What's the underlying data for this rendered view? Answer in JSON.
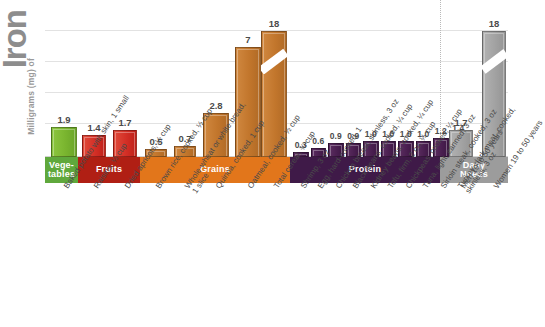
{
  "axis": {
    "title_main": "Iron",
    "title_units": "Milligrams (mg) of"
  },
  "bands": [
    {
      "key": "vegetables",
      "label": "Vege-\ntables",
      "color": "#5fa83c"
    },
    {
      "key": "fruits",
      "label": "Fruits",
      "color": "#b01f14"
    },
    {
      "key": "grains",
      "label": "Grains",
      "color": "#e2761b"
    },
    {
      "key": "protein",
      "label": "Protein",
      "color": "#3f1a48"
    },
    {
      "key": "daily_needs",
      "label": "Daily\nNeeds",
      "color": "#9c9c9c"
    }
  ],
  "chart_data": {
    "type": "bar",
    "title": "Iron",
    "ylabel": "Milligrams (mg) of Iron",
    "xlabel": "",
    "ylim": [
      0,
      8
    ],
    "grid": true,
    "legend": "none",
    "axis_break_note": "Bars for Total cereal (18 mg) and Women 19 to 50 years (18 mg) are drawn with a diagonal axis break.",
    "categories": [
      "Baked potato with skin, 1 small",
      "Raisins, ½ cup",
      "Dried apricots, ½ cup",
      "Brown rice, cooked, ½ cup",
      "Whole-wheat or white bread, 1 slice",
      "Quinoa, cooked, 1 cup",
      "Oatmeal, cooked, ½ cup",
      "Total cereal, ¾ cup",
      "Shrimp, 3 oz",
      "Egg, hard-cooked, 1",
      "Chicken breast, skinless, 3 oz",
      "Black beans, cooked, ¼ cup",
      "Kidney beans, cooked, ¼ cup",
      "Tofu, firm, 2 oz, ¼ cup",
      "Chickpeas, cooked, ¼ cup",
      "Tuna, light, canned, 3 oz",
      "Sirloin steak, cooked, 3 oz",
      "Turkey, dark meat, cooked, skinless, 3 oz",
      "Men 19 to 50 years",
      "Women 19 to 50 years"
    ],
    "values": [
      1.9,
      1.4,
      1.7,
      0.5,
      0.7,
      2.8,
      7,
      18,
      0.3,
      0.6,
      0.9,
      0.9,
      1.0,
      1.0,
      1.0,
      1.0,
      1.2,
      1.4,
      1.7,
      18
    ],
    "value_labels": [
      "1.9",
      "1.4",
      "1.7",
      "0.5",
      "0.7",
      "2.8",
      "7",
      "18",
      "0.3",
      "0.6",
      "0.9",
      "0.9",
      "1.0",
      "1.0",
      "1.0",
      "1.0",
      "1.2",
      "1.4",
      "1.7",
      "18"
    ],
    "groups": [
      "vegetables",
      "fruits",
      "fruits",
      "grains",
      "grains",
      "grains",
      "grains",
      "grains",
      "protein",
      "protein",
      "protein",
      "protein",
      "protein",
      "protein",
      "protein",
      "protein",
      "protein",
      "protein",
      "daily_needs",
      "daily_needs"
    ],
    "group_labels": {
      "vegetables": "Vege-tables",
      "fruits": "Fruits",
      "grains": "Grains",
      "protein": "Protein",
      "daily_needs": "Daily Needs"
    },
    "colors": {
      "vegetables": "#7ab52f",
      "fruits": "#d32f26",
      "grains": "#c2762c",
      "protein": "#4a1f50",
      "daily_needs": "#a2a2a2"
    }
  }
}
